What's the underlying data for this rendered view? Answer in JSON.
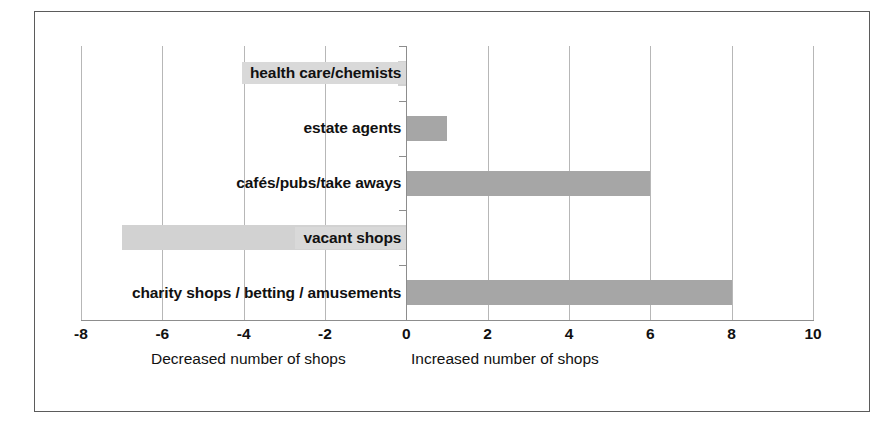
{
  "chart_data": {
    "type": "bar",
    "orientation": "horizontal",
    "title": "",
    "subtitle": "",
    "xlabel": "",
    "ylabel": "",
    "xlim": [
      -8,
      10
    ],
    "ylim": null,
    "grid": true,
    "legend": null,
    "legend_position": "none",
    "categories": [
      "health care/chemists",
      "estate agents",
      "cafés/pubs/take aways",
      "vacant shops",
      "charity shops / betting / amusements"
    ],
    "values": [
      -0.2,
      1,
      6,
      -7,
      8
    ],
    "xticks": [
      -8,
      -6,
      -4,
      -2,
      0,
      2,
      4,
      6,
      8,
      10
    ],
    "xtick_labels": [
      "-8",
      "-6",
      "-4",
      "-2",
      "0",
      "2",
      "4",
      "6",
      "8",
      "10"
    ],
    "annotations": [
      "Decreased number of shops",
      "Increased number of shops"
    ],
    "colors": {
      "positive_bar": "#a6a6a6",
      "negative_bar": "#d2d2d2",
      "gridline": "#b7b7b7",
      "axis": "#8d8d8d",
      "frame": "#5b5b5b",
      "background": "#ffffff",
      "label_text": "#111111",
      "label_highlight": "#d9d9d9"
    }
  },
  "axis_captions": {
    "decreased": "Decreased number of shops",
    "increased": "Increased number of shops"
  },
  "bars": [
    {
      "label": "health care/chemists",
      "value": -0.2,
      "sign": "negative",
      "highlight": true
    },
    {
      "label": "estate agents",
      "value": 1,
      "sign": "positive",
      "highlight": false
    },
    {
      "label": "cafés/pubs/take aways",
      "value": 6,
      "sign": "positive",
      "highlight": false
    },
    {
      "label": "vacant shops",
      "value": -7,
      "sign": "negative",
      "highlight": true
    },
    {
      "label": "charity shops / betting / amusements",
      "value": 8,
      "sign": "positive",
      "highlight": false
    }
  ]
}
